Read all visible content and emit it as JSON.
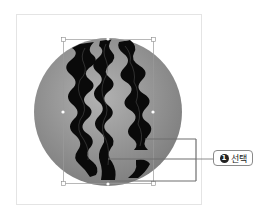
{
  "canvas": {
    "frame": {
      "x": 16,
      "y": 14,
      "width": 185,
      "height": 190,
      "border_color": "#e6e6e6"
    },
    "circle": {
      "cx": 108,
      "cy": 112,
      "r": 74,
      "fill_light": "#a8a8a8",
      "fill_dark": "#7a7a7a"
    },
    "stripe_color": "#0a0a0a",
    "selection_box": {
      "x": 63,
      "y": 39,
      "width": 90,
      "height": 144,
      "color": "#9a9a9a"
    }
  },
  "callout": {
    "badge_number": "1",
    "label": "선택",
    "line_color": "#6e6e6e"
  }
}
